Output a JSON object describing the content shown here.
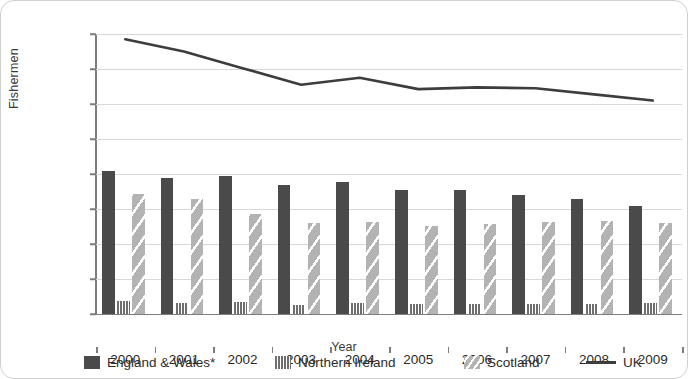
{
  "chart_data": {
    "type": "bar",
    "title": "",
    "subtitle": "",
    "xlabel": "Year",
    "ylabel": "Fishermen",
    "categories": [
      "2000",
      "2001",
      "2002",
      "2003",
      "2004",
      "2005",
      "2006",
      "2007",
      "2008",
      "2009"
    ],
    "ylim": [
      0,
      16000
    ],
    "ytick_step": 2000,
    "ytick_labels": [
      "0",
      "2,000",
      "4,000",
      "6,000",
      "8,000",
      "10,000",
      "12,000",
      "14,000",
      "16,000"
    ],
    "ytick_values": [
      0,
      2000,
      4000,
      6000,
      8000,
      10000,
      12000,
      14000,
      16000
    ],
    "grid": true,
    "grid_axis": "y",
    "legend_position": "bottom",
    "series": [
      {
        "name": "England & Wales*",
        "kind": "bar",
        "color": "#4a4a4a",
        "pattern": "solid",
        "values": [
          8150,
          7800,
          7900,
          7350,
          7550,
          7100,
          7100,
          6800,
          6550,
          6150
        ]
      },
      {
        "name": "Northern Ireland",
        "kind": "bar",
        "color": "#7a7a7a",
        "pattern": "vertical-stripes",
        "values": [
          750,
          620,
          700,
          500,
          650,
          580,
          550,
          600,
          570,
          650
        ]
      },
      {
        "name": "Scotland",
        "kind": "bar",
        "color": "#b3b3b3",
        "pattern": "diagonal-stripes",
        "values": [
          6850,
          6600,
          5700,
          5200,
          5250,
          5050,
          5150,
          5250,
          5300,
          5200
        ]
      },
      {
        "name": "UK",
        "kind": "line",
        "color": "#3d3d3d",
        "pattern": "solid-line",
        "values": [
          15700,
          15000,
          14050,
          13100,
          13500,
          12850,
          12950,
          12900,
          12550,
          12200
        ]
      }
    ]
  }
}
